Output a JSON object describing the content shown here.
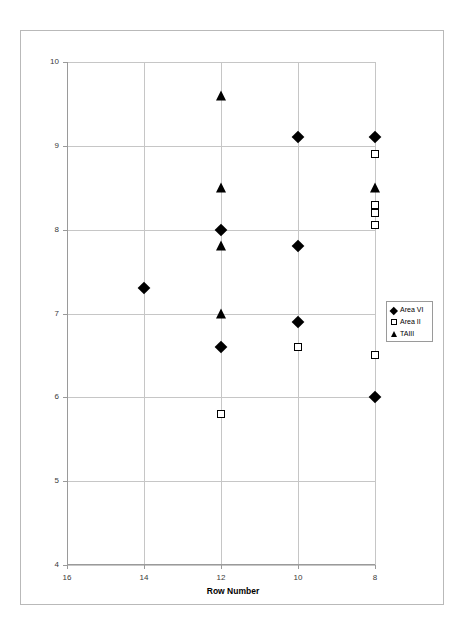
{
  "chart_data": {
    "type": "scatter",
    "title": "",
    "xlabel": "Row Number",
    "ylabel": "Cupule Width",
    "xlim": [
      16,
      8
    ],
    "ylim": [
      4,
      10
    ],
    "x_reversed": true,
    "xticks": [
      16,
      14,
      12,
      10,
      8
    ],
    "yticks": [
      4,
      5,
      6,
      7,
      8,
      9,
      10
    ],
    "xtick_labels": [
      "16",
      "14",
      "12",
      "10",
      "8"
    ],
    "ytick_labels": [
      "4",
      "5",
      "6",
      "7",
      "8",
      "9",
      "10"
    ],
    "grid": true,
    "legend_position": "right-middle",
    "series": [
      {
        "name": "Area VI",
        "marker": "filled-diamond",
        "color": "#000000",
        "points": [
          {
            "x": 14,
            "y": 7.3
          },
          {
            "x": 12,
            "y": 8.0
          },
          {
            "x": 12,
            "y": 6.6
          },
          {
            "x": 10,
            "y": 9.1
          },
          {
            "x": 10,
            "y": 7.8
          },
          {
            "x": 10,
            "y": 6.9
          },
          {
            "x": 8,
            "y": 9.1
          },
          {
            "x": 8,
            "y": 6.0
          }
        ]
      },
      {
        "name": "Area II",
        "marker": "open-square",
        "color": "#000000",
        "points": [
          {
            "x": 12,
            "y": 5.8
          },
          {
            "x": 10,
            "y": 6.6
          },
          {
            "x": 8,
            "y": 8.9
          },
          {
            "x": 8,
            "y": 8.3
          },
          {
            "x": 8,
            "y": 8.2
          },
          {
            "x": 8,
            "y": 8.05
          },
          {
            "x": 8,
            "y": 6.5
          }
        ]
      },
      {
        "name": "TAIII",
        "marker": "filled-triangle",
        "color": "#000000",
        "points": [
          {
            "x": 12,
            "y": 9.6
          },
          {
            "x": 12,
            "y": 8.5
          },
          {
            "x": 12,
            "y": 7.8
          },
          {
            "x": 12,
            "y": 7.0
          },
          {
            "x": 8,
            "y": 8.5
          }
        ]
      }
    ]
  },
  "legend": {
    "items": [
      {
        "label": "Area VI"
      },
      {
        "label": "Area II"
      },
      {
        "label": "TAIII"
      }
    ]
  }
}
